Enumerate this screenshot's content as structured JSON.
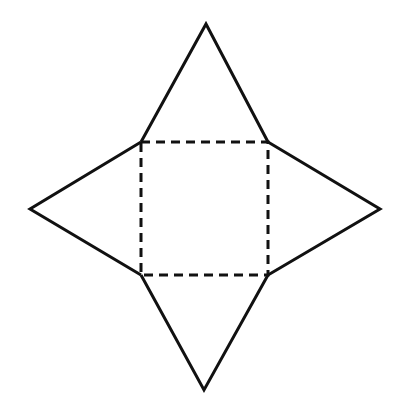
{
  "diagram": {
    "stroke_color": "#111111",
    "background": "#ffffff",
    "square_base": {
      "corners": [
        [
          141,
          142
        ],
        [
          268,
          142
        ],
        [
          268,
          275
        ],
        [
          141,
          275
        ]
      ],
      "style": "dashed"
    },
    "triangles": [
      {
        "name": "top",
        "apex": [
          206,
          24
        ],
        "base": [
          [
            141,
            142
          ],
          [
            268,
            142
          ]
        ]
      },
      {
        "name": "right",
        "apex": [
          380,
          209
        ],
        "base": [
          [
            268,
            142
          ],
          [
            268,
            275
          ]
        ]
      },
      {
        "name": "bottom",
        "apex": [
          204,
          390
        ],
        "base": [
          [
            268,
            275
          ],
          [
            141,
            275
          ]
        ]
      },
      {
        "name": "left",
        "apex": [
          30,
          209
        ],
        "base": [
          [
            141,
            275
          ],
          [
            141,
            142
          ]
        ]
      }
    ]
  }
}
